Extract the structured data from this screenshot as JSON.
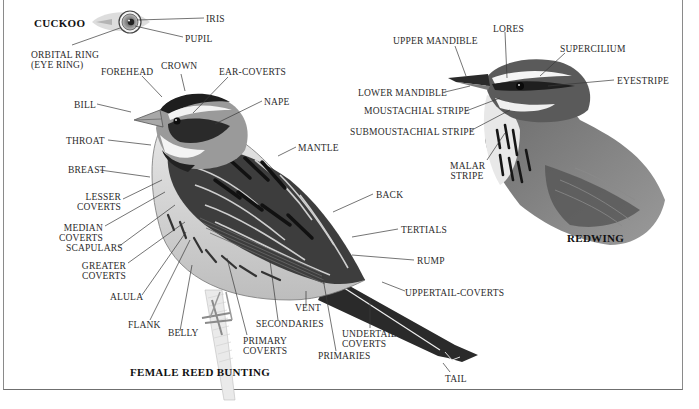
{
  "titles": {
    "cuckoo": "CUCKOO",
    "bunting": "FEMALE REED BUNTING",
    "redwing": "REDWING"
  },
  "cuckoo_labels": {
    "iris": "IRIS",
    "pupil": "PUPIL",
    "orbital_ring": "ORBITAL RING\n(EYE RING)"
  },
  "bunting_labels": {
    "forehead": "FOREHEAD",
    "crown": "CROWN",
    "ear_coverts": "EAR-COVERTS",
    "bill": "BILL",
    "nape": "NAPE",
    "throat": "THROAT",
    "breast": "BREAST",
    "mantle": "MANTLE",
    "lesser_coverts": "LESSER\nCOVERTS",
    "median_coverts": "MEDIAN\nCOVERTS",
    "scapulars": "SCAPULARS",
    "greater_coverts": "GREATER\nCOVERTS",
    "alula": "ALULA",
    "flank": "FLANK",
    "belly": "BELLY",
    "primary_coverts": "PRIMARY\nCOVERTS",
    "secondaries": "SECONDARIES",
    "vent": "VENT",
    "primaries": "PRIMARIES",
    "undertail_coverts": "UNDERTAIL-\nCOVERTS",
    "uppertail_coverts": "UPPERTAIL-COVERTS",
    "back": "BACK",
    "tertials": "TERTIALS",
    "rump": "RUMP",
    "tail": "TAIL"
  },
  "redwing_labels": {
    "upper_mandible": "UPPER MANDIBLE",
    "lores": "LORES",
    "supercilium": "SUPERCILIUM",
    "eyestripe": "EYESTRIPE",
    "lower_mandible": "LOWER MANDIBLE",
    "moustachial_stripe": "MOUSTACHIAL STRIPE",
    "submoustachial_stripe": "SUBMOUSTACHIAL STRIPE",
    "malar_stripe": "MALAR\nSTRIPE"
  },
  "colors": {
    "text": "#2b2b2b",
    "leader_line": "#3a3a3a",
    "frame": "#8a8a8a"
  }
}
